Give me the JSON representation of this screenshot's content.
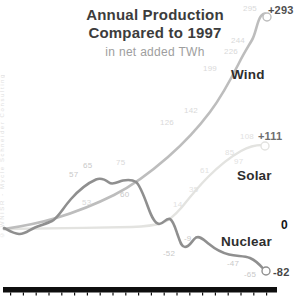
{
  "watermark": "© WNISR - Mycle Schneider Consulting",
  "title": {
    "line1": "Annual Production",
    "line2": "Compared to 1997",
    "subtitle": "in net added TWh"
  },
  "chart_data": {
    "type": "line",
    "title": "Annual Production Compared to 1997",
    "subtitle": "in net added TWh",
    "x_axis": {
      "tick_count": 21,
      "labels_visible": false
    },
    "baseline": {
      "label": "0",
      "pos": {
        "left": 281,
        "top": 219
      }
    },
    "series": [
      {
        "key": "solar",
        "name": "Solar",
        "color": "#e3e3e0",
        "label_color": "#e2e2df",
        "width": 2.4,
        "path": "M4,229 C40,228.5 90,228 132,227 C146,226.5 154,225.5 162,223 C170,220.5 176,214 182,207 C190,197 198,187 208,177 C220,165 232,156 241,151 C249,146.5 257,145 262,145",
        "endpoint": {
          "cx": 265,
          "cy": 146,
          "r": 4
        },
        "end_label": "+111",
        "end_label_pos": {
          "left": 258,
          "top": 130
        },
        "end_label_color": "#6e6e6e",
        "name_pos": {
          "left": 237,
          "top": 169
        },
        "point_labels": [
          {
            "text": "14",
            "left": 173,
            "top": 200
          },
          {
            "text": "35",
            "left": 189,
            "top": 185
          },
          {
            "text": "61",
            "left": 200,
            "top": 166
          },
          {
            "text": "85",
            "left": 225,
            "top": 148
          },
          {
            "text": "97",
            "left": 234,
            "top": 157
          },
          {
            "text": "108",
            "left": 240,
            "top": 132
          }
        ]
      },
      {
        "key": "wind",
        "name": "Wind",
        "color": "#bdbdbd",
        "label_color": "#d9d9d9",
        "width": 2.6,
        "path": "M4,229 C18,227 36,224 56,218 C76,212 96,204 114,195 C134,185 152,171 168,157 C184,143 198,128 210,112 C222,96 231,79 239,63 C244,53 248,47 252,40 C256,33 257,21 261,16 C264,13 266,13 266,15",
        "endpoint": {
          "cx": 267,
          "cy": 17,
          "r": 4
        },
        "end_label": "+293",
        "end_label_pos": {
          "left": 268,
          "top": 4
        },
        "end_label_color": "#4f4f4f",
        "name_pos": {
          "left": 231,
          "top": 68
        },
        "point_labels": [
          {
            "text": "53",
            "left": 82,
            "top": 198
          },
          {
            "text": "75",
            "left": 116,
            "top": 158
          },
          {
            "text": "126",
            "left": 160,
            "top": 118
          },
          {
            "text": "142",
            "left": 184,
            "top": 106
          },
          {
            "text": "199",
            "left": 203,
            "top": 64
          },
          {
            "text": "226",
            "left": 224,
            "top": 47
          },
          {
            "text": "244",
            "left": 231,
            "top": 36
          },
          {
            "text": "295",
            "left": 243,
            "top": 4
          }
        ]
      },
      {
        "key": "nuclear",
        "name": "Nuclear",
        "color": "#8f8f8f",
        "label_color": "#c9c9c9",
        "width": 2.6,
        "path": "M4,228 C8,230 13,233.5 19,234 C25,234.5 29,230 35,227.5 C41,225 47,223.5 52,221 C58,218 63,208 71,199 C79,190 88,183 96,179.5 C101,177.5 105,179.5 109,182.5 C113,185.5 118,181.5 123,180.5 C129,179.5 133,180 136,182 C140,185 144,196 148,207 C152,218 155,223.5 159,224 C163,224.5 166,217.5 170,219 C173,220.5 175,227 177,233 C180,241 181,247 185,247 C190,247 192,240 196,237.5 C200,235.5 204,240 209,244 C215,249 221,252.5 229,254.5 C237,256.5 244,255.5 250,258 C256,260.5 261,266 264,269.5",
        "endpoint": {
          "cx": 266,
          "cy": 271,
          "r": 4
        },
        "end_label": "-82",
        "end_label_pos": {
          "left": 273,
          "top": 266
        },
        "end_label_color": "#474747",
        "name_pos": {
          "left": 221,
          "top": 235
        },
        "point_labels": [
          {
            "text": "57",
            "left": 69,
            "top": 170
          },
          {
            "text": "65",
            "left": 83,
            "top": 161
          },
          {
            "text": "60",
            "left": 120,
            "top": 190
          },
          {
            "text": "-52",
            "left": 163,
            "top": 249
          },
          {
            "text": "-9",
            "left": 184,
            "top": 234
          },
          {
            "text": "-47",
            "left": 227,
            "top": 259
          },
          {
            "text": "-65",
            "left": 244,
            "top": 270
          }
        ]
      }
    ]
  }
}
